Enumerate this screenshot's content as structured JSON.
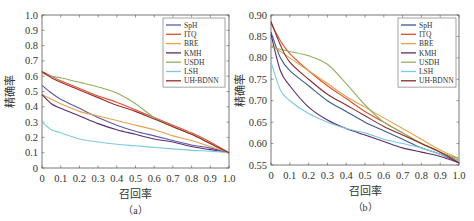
{
  "chart_data": [
    {
      "type": "line",
      "panel_label": "（a）",
      "xlabel": "召回率",
      "ylabel": "精确率",
      "xlim": [
        0,
        1.0
      ],
      "ylim": [
        0,
        1.0
      ],
      "xticks": [
        "0",
        "0.1",
        "0.2",
        "0.3",
        "0.4",
        "0.5",
        "0.6",
        "0.7",
        "0.8",
        "0.9",
        "1.0"
      ],
      "yticks": [
        "0",
        "0.1",
        "0.2",
        "0.3",
        "0.4",
        "0.5",
        "0.6",
        "0.7",
        "0.8",
        "0.9",
        "1.0"
      ],
      "grid": false,
      "legend_position": "upper right",
      "x": [
        0,
        0.05,
        0.1,
        0.2,
        0.3,
        0.4,
        0.5,
        0.6,
        0.7,
        0.8,
        0.9,
        1.0
      ],
      "series": [
        {
          "name": "SpH",
          "color": "#5a5aa8",
          "values": [
            0.54,
            0.49,
            0.45,
            0.39,
            0.33,
            0.28,
            0.24,
            0.21,
            0.18,
            0.15,
            0.13,
            0.1
          ]
        },
        {
          "name": "ITQ",
          "color": "#d9502b",
          "values": [
            0.63,
            0.6,
            0.57,
            0.52,
            0.47,
            0.43,
            0.38,
            0.33,
            0.28,
            0.23,
            0.17,
            0.1
          ]
        },
        {
          "name": "BRE",
          "color": "#e8a050",
          "values": [
            0.48,
            0.45,
            0.42,
            0.37,
            0.34,
            0.31,
            0.28,
            0.25,
            0.21,
            0.18,
            0.14,
            0.1
          ]
        },
        {
          "name": "KMH",
          "color": "#5b2a6e",
          "values": [
            0.48,
            0.42,
            0.39,
            0.34,
            0.29,
            0.25,
            0.22,
            0.19,
            0.17,
            0.14,
            0.12,
            0.1
          ]
        },
        {
          "name": "USDH",
          "color": "#8fb060",
          "values": [
            0.62,
            0.6,
            0.59,
            0.56,
            0.53,
            0.49,
            0.42,
            0.33,
            0.27,
            0.22,
            0.16,
            0.1
          ]
        },
        {
          "name": "LSH",
          "color": "#7fc8e0",
          "values": [
            0.3,
            0.25,
            0.23,
            0.19,
            0.17,
            0.155,
            0.145,
            0.135,
            0.125,
            0.115,
            0.11,
            0.1
          ]
        },
        {
          "name": "UH-BDNN",
          "color": "#9a2a2a",
          "values": [
            0.63,
            0.59,
            0.56,
            0.51,
            0.46,
            0.41,
            0.37,
            0.32,
            0.27,
            0.22,
            0.16,
            0.1
          ]
        }
      ]
    },
    {
      "type": "line",
      "panel_label": "（b）",
      "xlabel": "召回率",
      "ylabel": "精确率",
      "xlim": [
        0,
        1.0
      ],
      "ylim": [
        0.55,
        0.9
      ],
      "xticks": [
        "0",
        "0.1",
        "0.2",
        "0.3",
        "0.4",
        "0.5",
        "0.6",
        "0.7",
        "0.8",
        "0.9",
        "1.0"
      ],
      "yticks": [
        "0.55",
        "0.60",
        "0.65",
        "0.70",
        "0.75",
        "0.80",
        "0.85",
        "0.90"
      ],
      "grid": false,
      "legend_position": "upper right",
      "x": [
        0,
        0.05,
        0.1,
        0.2,
        0.3,
        0.4,
        0.5,
        0.6,
        0.7,
        0.8,
        0.9,
        1.0
      ],
      "series": [
        {
          "name": "SpH",
          "color": "#3a5a8a",
          "values": [
            0.86,
            0.8,
            0.77,
            0.735,
            0.7,
            0.675,
            0.65,
            0.63,
            0.61,
            0.59,
            0.575,
            0.555
          ]
        },
        {
          "name": "ITQ",
          "color": "#d9502b",
          "values": [
            0.88,
            0.84,
            0.81,
            0.77,
            0.735,
            0.705,
            0.675,
            0.65,
            0.625,
            0.6,
            0.58,
            0.56
          ]
        },
        {
          "name": "BRE",
          "color": "#e8a050",
          "values": [
            0.83,
            0.815,
            0.8,
            0.77,
            0.74,
            0.71,
            0.685,
            0.66,
            0.635,
            0.61,
            0.585,
            0.565
          ]
        },
        {
          "name": "KMH",
          "color": "#5b2a6e",
          "values": [
            0.855,
            0.77,
            0.735,
            0.685,
            0.655,
            0.635,
            0.62,
            0.605,
            0.59,
            0.58,
            0.57,
            0.555
          ]
        },
        {
          "name": "USDH",
          "color": "#8fb060",
          "values": [
            0.825,
            0.82,
            0.815,
            0.805,
            0.785,
            0.74,
            0.69,
            0.65,
            0.625,
            0.6,
            0.58,
            0.565
          ]
        },
        {
          "name": "LSH",
          "color": "#7fc8e0",
          "values": [
            0.79,
            0.725,
            0.7,
            0.67,
            0.65,
            0.635,
            0.625,
            0.61,
            0.6,
            0.59,
            0.575,
            0.56
          ]
        },
        {
          "name": "UH-BDNN",
          "color": "#8a2a2a",
          "values": [
            0.885,
            0.83,
            0.79,
            0.75,
            0.715,
            0.69,
            0.665,
            0.64,
            0.62,
            0.6,
            0.58,
            0.555
          ]
        }
      ]
    }
  ]
}
